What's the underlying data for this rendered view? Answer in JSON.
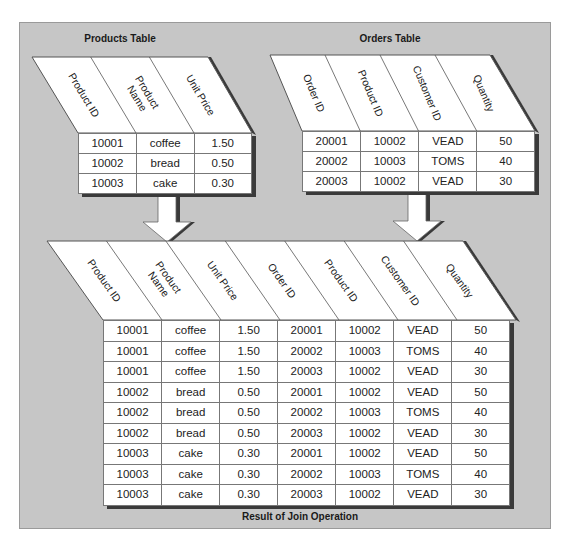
{
  "diagram": {
    "background_color": "#c6c6c6",
    "products_table": {
      "title": "Products Table",
      "columns": [
        "Product ID",
        "Product Name",
        "Unit Price"
      ],
      "column_lines": [
        [
          "Product ID"
        ],
        [
          "Product",
          "Name"
        ],
        [
          "Unit Price"
        ]
      ],
      "rows": [
        [
          "10001",
          "coffee",
          "1.50"
        ],
        [
          "10002",
          "bread",
          "0.50"
        ],
        [
          "10003",
          "cake",
          "0.30"
        ]
      ]
    },
    "orders_table": {
      "title": "Orders Table",
      "columns": [
        "Order ID",
        "Product ID",
        "Customer ID",
        "Quantity"
      ],
      "column_lines": [
        [
          "Order ID"
        ],
        [
          "Product ID"
        ],
        [
          "Customer ID"
        ],
        [
          "Quantity"
        ]
      ],
      "rows": [
        [
          "20001",
          "10002",
          "VEAD",
          "50"
        ],
        [
          "20002",
          "10003",
          "TOMS",
          "40"
        ],
        [
          "20003",
          "10002",
          "VEAD",
          "30"
        ]
      ]
    },
    "join_table": {
      "title": "Result of Join Operation",
      "columns": [
        "Product ID",
        "Product Name",
        "Unit Price",
        "Order ID",
        "Product ID",
        "Customer ID",
        "Quantity"
      ],
      "column_lines": [
        [
          "Product ID"
        ],
        [
          "Product",
          "Name"
        ],
        [
          "Unit Price"
        ],
        [
          "Order ID"
        ],
        [
          "Product ID"
        ],
        [
          "Customer ID"
        ],
        [
          "Quantity"
        ]
      ],
      "rows": [
        [
          "10001",
          "coffee",
          "1.50",
          "20001",
          "10002",
          "VEAD",
          "50"
        ],
        [
          "10001",
          "coffee",
          "1.50",
          "20002",
          "10003",
          "TOMS",
          "40"
        ],
        [
          "10001",
          "coffee",
          "1.50",
          "20003",
          "10002",
          "VEAD",
          "30"
        ],
        [
          "10002",
          "bread",
          "0.50",
          "20001",
          "10002",
          "VEAD",
          "50"
        ],
        [
          "10002",
          "bread",
          "0.50",
          "20002",
          "10003",
          "TOMS",
          "40"
        ],
        [
          "10002",
          "bread",
          "0.50",
          "20003",
          "10002",
          "VEAD",
          "30"
        ],
        [
          "10003",
          "cake",
          "0.30",
          "20001",
          "10002",
          "VEAD",
          "50"
        ],
        [
          "10003",
          "cake",
          "0.30",
          "20002",
          "10003",
          "TOMS",
          "40"
        ],
        [
          "10003",
          "cake",
          "0.30",
          "20003",
          "10002",
          "VEAD",
          "30"
        ]
      ]
    },
    "arrows": [
      {
        "from": "products_table",
        "to": "join_table"
      },
      {
        "from": "orders_table",
        "to": "join_table"
      }
    ]
  }
}
